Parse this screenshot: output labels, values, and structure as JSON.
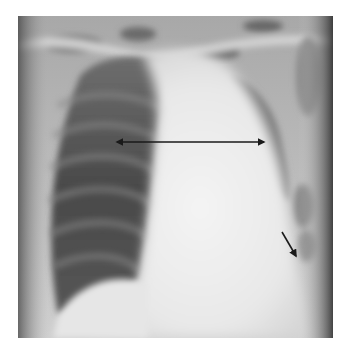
{
  "figure": {
    "type": "chest-radiograph",
    "view": "frontal",
    "annotations": [
      {
        "kind": "double-arrow",
        "from": [
          117,
          142
        ],
        "to": [
          264,
          142
        ],
        "color": "#1a1a1a"
      },
      {
        "kind": "arrow",
        "from": [
          282,
          232
        ],
        "to": [
          296,
          256
        ],
        "color": "#1a1a1a"
      }
    ]
  }
}
